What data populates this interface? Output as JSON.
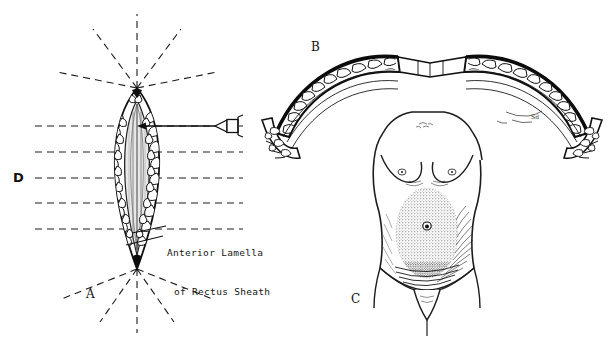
{
  "figure": {
    "kind": "medical-illustration",
    "width": 608,
    "height": 343,
    "background_color": "#ffffff",
    "ink_color": "#111111"
  },
  "panels": [
    {
      "id": "a",
      "letter": "A",
      "caption_x": 86,
      "caption_y": 288,
      "description": "Cross-section of rectus sheath incision, pointed-oval (lens) shape with radiating dashed planes"
    },
    {
      "id": "b",
      "letter": "B",
      "caption_x": 311,
      "caption_y": 41,
      "description": "Curved arc cross-section of abdominal wall tissue layers, left and right halves"
    },
    {
      "id": "c",
      "letter": "C",
      "caption_x": 351,
      "caption_y": 293,
      "description": "Anterior view of female torso with stippled shaded abdominal region around umbilicus"
    },
    {
      "id": "d",
      "letter": "D",
      "caption_x": 13,
      "caption_y": 171,
      "description": "Stack of horizontal dashed section planes through panel A"
    }
  ],
  "annotations": {
    "rectus_sheath_label": {
      "line1": "Anterior Lamella",
      "line2": "of Rectus Sheath",
      "x": 167,
      "y": 220
    },
    "artist_signature": {
      "text": "Sd",
      "x": 534,
      "y": 118
    }
  },
  "icons": {
    "needle": {
      "name": "needle-icon",
      "tip_x": 215,
      "hub_x": 241,
      "y": 126
    },
    "arrow": {
      "name": "injection-arrow",
      "from_x": 240,
      "to_x": 137,
      "y": 126
    }
  },
  "section_planes_d": {
    "count": 5,
    "x_start": 35,
    "x_end": 243,
    "y_values": [
      126,
      152,
      178,
      203,
      229
    ]
  },
  "radiating_planes_a": {
    "top_apex": {
      "x": 137,
      "y": 88
    },
    "bottom_apex": {
      "x": 137,
      "y": 269
    },
    "count_per_apex": 5
  }
}
